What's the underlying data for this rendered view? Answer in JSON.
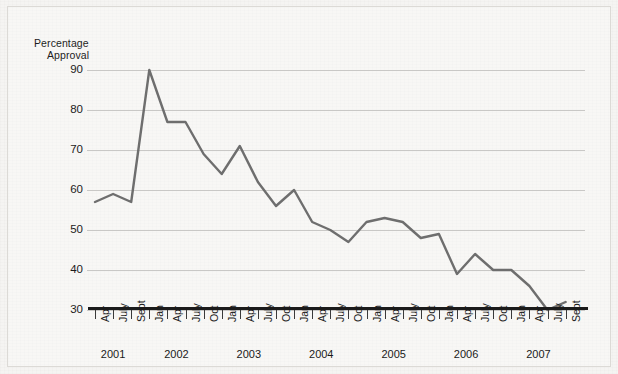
{
  "axis_title_line1": "Percentage",
  "axis_title_line2": "Approval",
  "colors": {
    "line": "#6e6e6e",
    "gridline": "#c9c8c6",
    "baseline": "#1b1b1b",
    "background": "#f5f4f2",
    "text": "#1a1a1a"
  },
  "chart_data": {
    "type": "line",
    "title": "",
    "xlabel": "",
    "ylabel": "Percentage Approval",
    "ylim": [
      30,
      90
    ],
    "yticks": [
      30,
      40,
      50,
      60,
      70,
      80,
      90
    ],
    "grid": true,
    "legend": false,
    "x_tick_labels": [
      "Apr",
      "July",
      "Sept",
      "Jan",
      "Apr",
      "July",
      "Oct",
      "Jan",
      "Apr",
      "July",
      "Oct",
      "Jan",
      "Apr",
      "July",
      "Oct",
      "Jan",
      "Apr",
      "July",
      "Oct",
      "Jan",
      "Apr",
      "July",
      "Oct",
      "Jan",
      "Apr",
      "July",
      "Sept"
    ],
    "year_labels": [
      "2001",
      "2002",
      "2003",
      "2004",
      "2005",
      "2006",
      "2007"
    ],
    "points": [
      {
        "label": "Apr 2001",
        "value": 57
      },
      {
        "label": "July 2001",
        "value": 59
      },
      {
        "label": "Sept 2001",
        "value": 57
      },
      {
        "label": "Jan 2002",
        "value": 90
      },
      {
        "label": "Apr 2002",
        "value": 77
      },
      {
        "label": "July 2002",
        "value": 77
      },
      {
        "label": "Oct 2002",
        "value": 69
      },
      {
        "label": "Jan 2003",
        "value": 64
      },
      {
        "label": "Apr 2003",
        "value": 71
      },
      {
        "label": "July 2003",
        "value": 62
      },
      {
        "label": "Oct 2003",
        "value": 56
      },
      {
        "label": "Jan 2004",
        "value": 60
      },
      {
        "label": "Apr 2004",
        "value": 52
      },
      {
        "label": "July 2004",
        "value": 50
      },
      {
        "label": "Oct 2004",
        "value": 47
      },
      {
        "label": "Jan 2005",
        "value": 52
      },
      {
        "label": "Apr 2005",
        "value": 53
      },
      {
        "label": "July 2005",
        "value": 52
      },
      {
        "label": "Oct 2005",
        "value": 48
      },
      {
        "label": "Jan 2006",
        "value": 49
      },
      {
        "label": "Apr 2006",
        "value": 39
      },
      {
        "label": "July 2006",
        "value": 44
      },
      {
        "label": "Oct 2006",
        "value": 40
      },
      {
        "label": "Jan 2007",
        "value": 40
      },
      {
        "label": "Apr 2007",
        "value": 36
      },
      {
        "label": "July 2007",
        "value": 30
      },
      {
        "label": "Sept 2007",
        "value": 32
      }
    ]
  }
}
